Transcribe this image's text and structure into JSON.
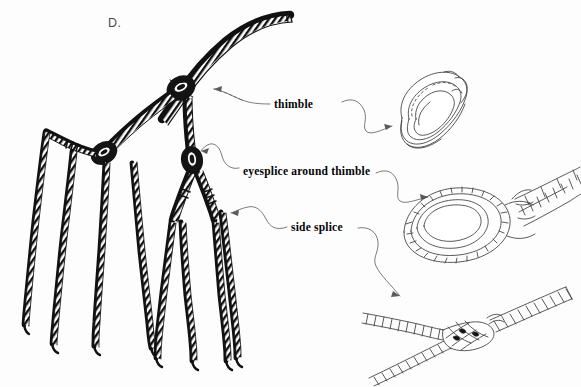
{
  "figure": {
    "panel_letter": "D.",
    "background_color": "#fdfdfd",
    "ink_color": "#111111",
    "leader_color": "#636363"
  },
  "labels": [
    {
      "id": "thimble",
      "text": "thimble",
      "x": 274,
      "y": 98
    },
    {
      "id": "eyesplice",
      "text": "eyesplice around thimble",
      "x": 243,
      "y": 165
    },
    {
      "id": "side_splice",
      "text": "side splice",
      "x": 291,
      "y": 221
    }
  ],
  "illustrations": [
    {
      "id": "thimble-detail",
      "name": "thimble-detail-drawing",
      "description": "teardrop shaped grooved metal thimble, thin outline"
    },
    {
      "id": "eyesplice-detail",
      "name": "eyesplice-detail-drawing",
      "description": "rope eye splice formed around a thimble with dark shaded groove"
    },
    {
      "id": "side-splice-detail",
      "name": "side-splice-detail-drawing",
      "description": "two twisted ropes joined by a side splice"
    }
  ],
  "main_assembly": {
    "name": "branching-rope-assembly",
    "description": "main rope arcing to upper right with junction knots and eight hanging strands",
    "strand_count": 8,
    "junction_count": 6
  }
}
